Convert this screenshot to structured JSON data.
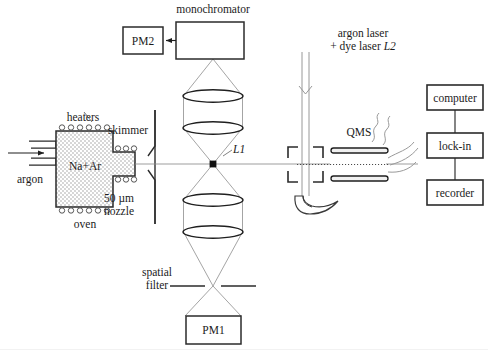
{
  "figure": {
    "stroke": "#2b2b2b",
    "thin_stroke": "#6b6b6b",
    "hatch_color": "#8a8a8a",
    "background": "#ffffff"
  },
  "source": {
    "oven_label": "oven",
    "heaters_label": "heaters",
    "gas_inlet_label": "argon",
    "chamber_contents": "Na+Ar",
    "nozzle_label": "50 µm",
    "nozzle_label2": "nozzle",
    "skimmer_label": "skimmer"
  },
  "optics": {
    "monochromator_label": "monochromator",
    "pm2_label": "PM2",
    "pm1_label": "PM1",
    "focus_label": "L1",
    "spatial_filter_label": "spatial",
    "spatial_filter_label2": "filter"
  },
  "laser": {
    "line1": "argon laser",
    "line2_prefix": "+ dye laser ",
    "line2_italic": "L2"
  },
  "detector": {
    "qms_label": "QMS"
  },
  "electronics": {
    "boxes": [
      {
        "label": "computer"
      },
      {
        "label": "lock-in"
      },
      {
        "label": "recorder"
      }
    ]
  }
}
